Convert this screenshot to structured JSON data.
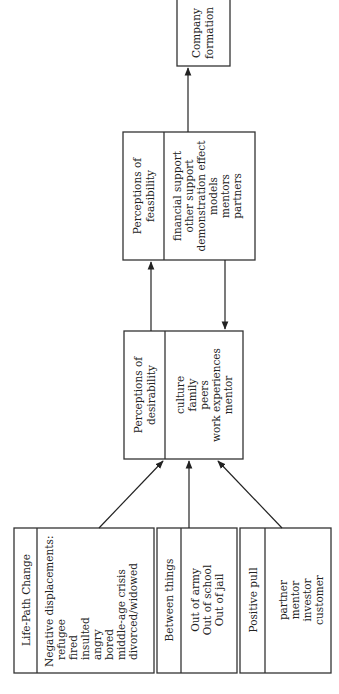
{
  "diagram": {
    "orientation": "rotated-90-ccw",
    "nodes": {
      "life_path": {
        "title": "Life-Path Change",
        "lines": [
          "Negative displacements:",
          "refugee",
          "fired",
          "insulted",
          "angry",
          "bored",
          "middle-age crisis",
          "divorced/widowed"
        ]
      },
      "between": {
        "title": "Between things",
        "lines": [
          "Out of army",
          "Out of school",
          "Out of jail"
        ]
      },
      "positive": {
        "title": "Positive pull",
        "lines": [
          "partner",
          "mentor",
          "investor",
          "customer"
        ]
      },
      "desirability": {
        "title_lines": [
          "Perceptions of",
          "desirability"
        ],
        "lines": [
          "culture",
          "family",
          "peers",
          "work experiences",
          "mentor"
        ]
      },
      "feasibility": {
        "title_lines": [
          "Perceptions of",
          "feasibility"
        ],
        "lines": [
          "financial support",
          "other support",
          "demonstration effect",
          "models",
          "mentors",
          "partners"
        ]
      },
      "company": {
        "title_lines": [
          "Company",
          "formation"
        ]
      }
    },
    "edges": [
      {
        "from": "life_path",
        "to": "desirability"
      },
      {
        "from": "between",
        "to": "desirability"
      },
      {
        "from": "positive",
        "to": "desirability"
      },
      {
        "from": "desirability",
        "to": "feasibility"
      },
      {
        "from": "feasibility",
        "to": "desirability"
      },
      {
        "from": "feasibility",
        "to": "company"
      }
    ],
    "colors": {
      "stroke": "#333333",
      "text": "#222222",
      "background": "#ffffff"
    }
  }
}
